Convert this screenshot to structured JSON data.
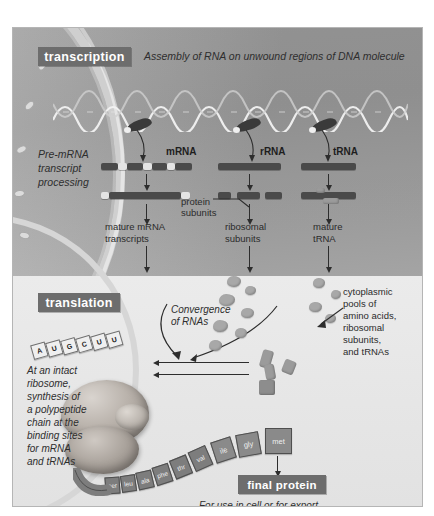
{
  "figure": {
    "panel_bg": "#e9e9e9",
    "nucleus_bg": "#9d9d9d",
    "chip_bg": "#6d6d6d",
    "chip_text_color": "#ffffff"
  },
  "transcription": {
    "chip_label": "transcription",
    "caption": "Assembly of RNA on unwound regions of DNA molecule",
    "processing_label_line1": "Pre-mRNA",
    "processing_label_line2": "transcript",
    "processing_label_line3": "processing",
    "rna_types": [
      {
        "name": "mRNA",
        "product_line1": "mature mRNA",
        "product_line2": "transcripts"
      },
      {
        "name": "rRNA",
        "product_line1": "ribosomal",
        "product_line2": "subunits"
      },
      {
        "name": "tRNA",
        "product_line1": "mature",
        "product_line2": "tRNA"
      }
    ],
    "protein_subunits_line1": "protein",
    "protein_subunits_line2": "subunits"
  },
  "translation": {
    "chip_label": "translation",
    "convergence_line1": "Convergence",
    "convergence_line2": "of RNAs",
    "pools": [
      "cytoplasmic",
      "pools of",
      "amino acids,",
      "ribosomal",
      "subunits,",
      "and tRNAs"
    ],
    "ribosome_note": [
      "At an intact",
      "ribosome,",
      "synthesis of",
      "a polypeptide",
      "chain at the",
      "binding sites",
      "for mRNA",
      "and tRNAs"
    ],
    "mrna_codon_letters": [
      "A",
      "U",
      "G",
      "C",
      "U",
      "U"
    ],
    "polypeptide_residues": [
      "ser",
      "leu",
      "ala",
      "phe",
      "thr",
      "val",
      "ile",
      "gly",
      "met"
    ]
  },
  "final_protein": {
    "chip_label": "final protein",
    "caption": "For use in cell or for export"
  }
}
